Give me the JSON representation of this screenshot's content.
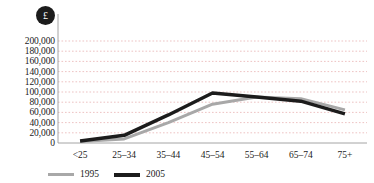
{
  "chart_data": {
    "type": "line",
    "title": "",
    "subtitle": "",
    "xlabel": "",
    "ylabel": "",
    "unit_badge": "£",
    "categories": [
      "<25",
      "25–34",
      "35–44",
      "45–54",
      "55–64",
      "65–74",
      "75+"
    ],
    "ylim": [
      0,
      200000
    ],
    "ytick_step": 20000,
    "ytick_labels": [
      "200,000",
      "180,000",
      "160,000",
      "140,000",
      "120,000",
      "100,000",
      "80,000",
      "60,000",
      "40,000",
      "20,000",
      "0"
    ],
    "ytick_values": [
      200000,
      180000,
      160000,
      140000,
      120000,
      100000,
      80000,
      60000,
      40000,
      20000,
      0
    ],
    "grid": true,
    "grid_style": "dotted",
    "grid_color": "#e8b4b4",
    "legend_position": "bottom-left",
    "series": [
      {
        "name": "1995",
        "color": "#a8a8a8",
        "width": 3,
        "values": [
          3000,
          8000,
          40000,
          76000,
          90000,
          87000,
          65000
        ]
      },
      {
        "name": "2005",
        "color": "#1c1c1c",
        "width": 3.5,
        "values": [
          4000,
          15000,
          55000,
          98000,
          90000,
          82000,
          57000
        ]
      }
    ]
  },
  "legend": {
    "items": [
      {
        "label": "1995"
      },
      {
        "label": "2005"
      }
    ]
  },
  "axis": {
    "axis_color": "#9a9a9a",
    "badge_bg": "#1c1c1c",
    "badge_fg": "#ffffff"
  }
}
